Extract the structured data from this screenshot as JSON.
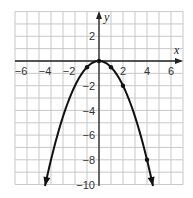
{
  "chart_data": {
    "type": "line",
    "title": "",
    "xlabel": "x",
    "ylabel": "y",
    "xlim": [
      -7,
      7
    ],
    "ylim": [
      -10,
      4
    ],
    "grid": true,
    "function": "y = -x^2/2",
    "x_ticks": [
      "-6",
      "-4",
      "-2",
      "2",
      "4",
      "6"
    ],
    "y_ticks": [
      "2",
      "-2",
      "-4",
      "-6",
      "-8",
      "-10"
    ],
    "points": [
      {
        "x": -1,
        "y": -0.5
      },
      {
        "x": 0,
        "y": 0
      },
      {
        "x": 1,
        "y": -0.5
      },
      {
        "x": 2,
        "y": -2
      },
      {
        "x": 4,
        "y": -8
      }
    ],
    "curve_x_range": [
      -4.5,
      4.5
    ],
    "arrows": "both ends"
  },
  "labels": {
    "x_axis": "x",
    "y_axis": "y",
    "xt": [
      "−6",
      "−4",
      "−2",
      "2",
      "4",
      "6"
    ],
    "yt": [
      "2",
      "−2",
      "−4",
      "−6",
      "−8",
      "−10"
    ]
  }
}
